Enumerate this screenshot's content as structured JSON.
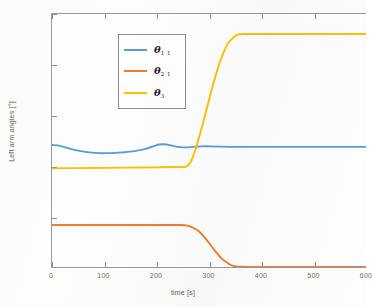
{
  "chart_data": {
    "type": "line",
    "title": "",
    "xlabel": "time [s]",
    "ylabel": "Left arm angles [°]",
    "xlim": [
      0,
      600
    ],
    "ylim": [
      40,
      140
    ],
    "xticks": [
      0,
      100,
      200,
      300,
      400,
      500,
      600
    ],
    "xticklabels": [
      "0",
      "100",
      "200",
      "300",
      "400",
      "500",
      "600"
    ],
    "yticks": [
      40,
      60,
      80,
      100,
      120,
      140
    ],
    "yticklabels": [
      "40",
      "60",
      "80",
      "100",
      "120",
      "140"
    ],
    "grid": false,
    "legend_position": "upper left",
    "series": [
      {
        "name": "theta_1_1",
        "label": "θ",
        "subscript": "1 1",
        "color": "#5B9BD5",
        "x": [
          0,
          15,
          30,
          45,
          60,
          75,
          90,
          105,
          120,
          135,
          150,
          165,
          180,
          195,
          205,
          215,
          225,
          235,
          245,
          255,
          265,
          275,
          285,
          300,
          320,
          350,
          400,
          450,
          500,
          550,
          600
        ],
        "y": [
          88.2,
          87.9,
          87.0,
          86.2,
          85.6,
          85.2,
          85.0,
          85.0,
          85.1,
          85.3,
          85.6,
          86.1,
          86.8,
          87.8,
          88.4,
          88.5,
          88.2,
          87.7,
          87.4,
          87.3,
          87.4,
          87.6,
          87.7,
          87.7,
          87.6,
          87.5,
          87.5,
          87.5,
          87.5,
          87.5,
          87.5
        ]
      },
      {
        "name": "theta_2_1",
        "label": "θ",
        "subscript": "2 1",
        "color": "#ED7D31",
        "x": [
          0,
          50,
          100,
          150,
          200,
          240,
          255,
          265,
          280,
          295,
          310,
          325,
          340,
          350,
          360,
          400,
          450,
          500,
          550,
          600
        ],
        "y": [
          56.6,
          56.6,
          56.6,
          56.6,
          56.6,
          56.6,
          56.5,
          56.0,
          54.2,
          50.8,
          46.8,
          43.2,
          41.0,
          40.3,
          40.1,
          40.0,
          40.0,
          40.0,
          40.0,
          40.0
        ]
      },
      {
        "name": "theta_3",
        "label": "θ",
        "subscript": "3",
        "color": "#FFC000",
        "x": [
          0,
          50,
          100,
          150,
          200,
          240,
          255,
          265,
          275,
          290,
          305,
          320,
          335,
          350,
          360,
          370,
          400,
          450,
          500,
          550,
          600
        ],
        "y": [
          79.0,
          79.1,
          79.2,
          79.3,
          79.4,
          79.5,
          79.6,
          81.5,
          87.0,
          98.0,
          110.0,
          120.5,
          128.0,
          131.3,
          132.0,
          132.1,
          132.1,
          132.1,
          132.1,
          132.1,
          132.1
        ]
      }
    ]
  },
  "legend": {
    "entries": [
      {
        "label": "θ",
        "subscript": "1 1",
        "color": "#5B9BD5"
      },
      {
        "label": "θ",
        "subscript": "2 1",
        "color": "#ED7D31"
      },
      {
        "label": "θ",
        "subscript": "3",
        "color": "#FFC000"
      }
    ]
  },
  "axes": {
    "y_title": "Left arm angles [°]",
    "x_title": "time [s]"
  }
}
